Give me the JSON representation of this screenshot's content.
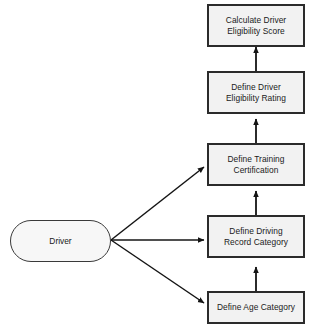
{
  "diagram": {
    "type": "dependency-flowchart",
    "actor": {
      "id": "driver",
      "label": "Driver",
      "shape": "stadium"
    },
    "nodes": [
      {
        "id": "calculate-driver-eligibility-score",
        "label": "Calculate Driver\nEligibility Score",
        "shape": "rectangle"
      },
      {
        "id": "define-driver-eligibility-rating",
        "label": "Define Driver\nEligibility Rating",
        "shape": "rectangle"
      },
      {
        "id": "define-training-certification",
        "label": "Define Training\nCertification",
        "shape": "rectangle"
      },
      {
        "id": "define-driving-record-category",
        "label": "Define Driving\nRecord Category",
        "shape": "rectangle"
      },
      {
        "id": "define-age-category",
        "label": "Define Age Category",
        "shape": "rectangle"
      }
    ],
    "edges": [
      {
        "from": "driver",
        "to": "define-training-certification",
        "style": "diagonal-arrow"
      },
      {
        "from": "driver",
        "to": "define-driving-record-category",
        "style": "horizontal-arrow"
      },
      {
        "from": "driver",
        "to": "define-age-category",
        "style": "diagonal-arrow"
      },
      {
        "from": "define-age-category",
        "to": "define-driving-record-category",
        "style": "vertical-arrow"
      },
      {
        "from": "define-driving-record-category",
        "to": "define-training-certification",
        "style": "vertical-arrow"
      },
      {
        "from": "define-training-certification",
        "to": "define-driver-eligibility-rating",
        "style": "vertical-arrow"
      },
      {
        "from": "define-driver-eligibility-rating",
        "to": "calculate-driver-eligibility-score",
        "style": "vertical-arrow"
      }
    ],
    "colors": {
      "node_fill": "#f2f2f2",
      "node_border": "#2b2b2b",
      "actor_fill": "#f7f7f7",
      "actor_border": "#3a3a3a",
      "edge": "#1a1a1a",
      "background": "#ffffff"
    }
  }
}
